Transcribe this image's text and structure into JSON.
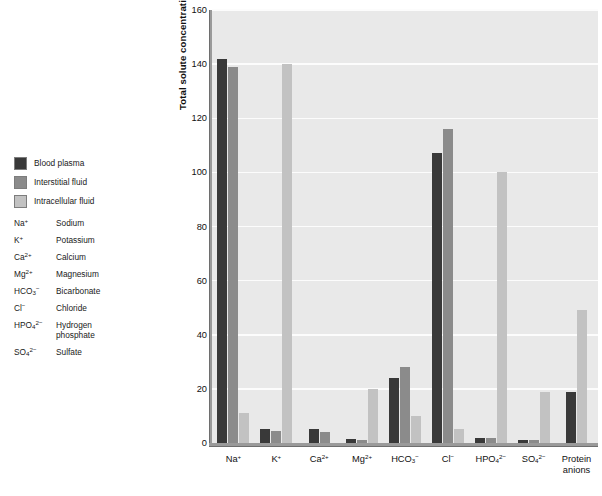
{
  "legend": {
    "series": [
      {
        "label": "Blood plasma",
        "color": "#393939"
      },
      {
        "label": "Interstitial fluid",
        "color": "#8b8b8b"
      },
      {
        "label": "Intracellular fluid",
        "color": "#c2c2c2"
      }
    ]
  },
  "abbreviations": [
    {
      "symbol": "Na+",
      "symbol_base": "Na",
      "symbol_sup": "+",
      "symbol_sub": "",
      "name": "Sodium",
      "name2": ""
    },
    {
      "symbol": "K+",
      "symbol_base": "K",
      "symbol_sup": "+",
      "symbol_sub": "",
      "name": "Potassium",
      "name2": ""
    },
    {
      "symbol": "Ca2+",
      "symbol_base": "Ca",
      "symbol_sup": "2+",
      "symbol_sub": "",
      "name": "Calcium",
      "name2": ""
    },
    {
      "symbol": "Mg2+",
      "symbol_base": "Mg",
      "symbol_sup": "2+",
      "symbol_sub": "",
      "name": "Magnesium",
      "name2": ""
    },
    {
      "symbol": "HCO3-",
      "symbol_base": "HCO",
      "symbol_sup": "−",
      "symbol_sub": "3",
      "name": "Bicarbonate",
      "name2": ""
    },
    {
      "symbol": "Cl-",
      "symbol_base": "Cl",
      "symbol_sup": "−",
      "symbol_sub": "",
      "name": "Chloride",
      "name2": ""
    },
    {
      "symbol": "HPO4 2-",
      "symbol_base": "HPO",
      "symbol_sup": "2−",
      "symbol_sub": "4",
      "name": "Hydrogen",
      "name2": "phosphate"
    },
    {
      "symbol": "SO4 2-",
      "symbol_base": "SO",
      "symbol_sup": "2−",
      "symbol_sub": "4",
      "name": "Sulfate",
      "name2": ""
    }
  ],
  "chart_data": {
    "type": "bar",
    "title": "",
    "xlabel": "",
    "ylabel": "Total solute concentration (mEq/L)",
    "ylim": [
      0,
      160
    ],
    "yticks": [
      0,
      20,
      40,
      60,
      80,
      100,
      120,
      140,
      160
    ],
    "grid": true,
    "legend_position": "left-outside",
    "categories": [
      "Na+",
      "K+",
      "Ca2+",
      "Mg2+",
      "HCO3-",
      "Cl-",
      "HPO4 2-",
      "SO4 2-",
      "Protein anions"
    ],
    "category_labels": [
      {
        "base": "Na",
        "sup": "+",
        "sub": "",
        "line2": ""
      },
      {
        "base": "K",
        "sup": "+",
        "sub": "",
        "line2": ""
      },
      {
        "base": "Ca",
        "sup": "2+",
        "sub": "",
        "line2": ""
      },
      {
        "base": "Mg",
        "sup": "2+",
        "sub": "",
        "line2": ""
      },
      {
        "base": "HCO",
        "sup": "−",
        "sub": "3",
        "line2": ""
      },
      {
        "base": "Cl",
        "sup": "−",
        "sub": "",
        "line2": ""
      },
      {
        "base": "HPO",
        "sup": "2−",
        "sub": "4",
        "line2": ""
      },
      {
        "base": "SO",
        "sup": "2−",
        "sub": "4",
        "line2": ""
      },
      {
        "base": "Protein",
        "sup": "",
        "sub": "",
        "line2": "anions"
      }
    ],
    "series": [
      {
        "name": "Blood plasma",
        "color": "#393939",
        "values": [
          142,
          5,
          5,
          1.5,
          24,
          107,
          2,
          1,
          19
        ]
      },
      {
        "name": "Interstitial fluid",
        "color": "#8b8b8b",
        "values": [
          139,
          4.5,
          4,
          1,
          28,
          116,
          2,
          1,
          0
        ]
      },
      {
        "name": "Intracellular fluid",
        "color": "#c2c2c2",
        "values": [
          11,
          140,
          0,
          20,
          10,
          5,
          100,
          19,
          49
        ]
      }
    ]
  }
}
